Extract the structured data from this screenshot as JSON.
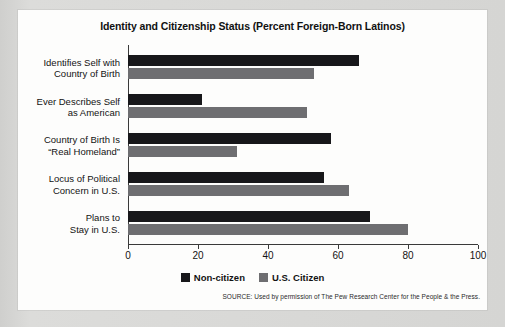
{
  "chart_data": {
    "type": "bar",
    "orientation": "horizontal",
    "title": "Identity and Citizenship Status (Percent Foreign-Born Latinos)",
    "xlabel": "",
    "ylabel": "",
    "xlim": [
      0,
      100
    ],
    "xticks": [
      0,
      20,
      40,
      60,
      80,
      100
    ],
    "xtick_labels": [
      "0",
      "20",
      "40",
      "60",
      "80",
      "100"
    ],
    "grid": false,
    "legend_position": "bottom-center",
    "categories": [
      "Identifies Self with\nCountry of Birth",
      "Ever Describes Self\nas American",
      "Country of Birth Is\n“Real Homeland”",
      "Locus of Political\nConcern in U.S.",
      "Plans to\nStay in U.S."
    ],
    "category_lines": [
      [
        "Identifies Self with",
        "Country of Birth"
      ],
      [
        "Ever Describes Self",
        "as American"
      ],
      [
        "Country of Birth Is",
        "“Real Homeland”"
      ],
      [
        "Locus of Political",
        "Concern in U.S."
      ],
      [
        "Plans to",
        "Stay in U.S."
      ]
    ],
    "series": [
      {
        "name": "Non-citizen",
        "color": "#17171a",
        "values": [
          66,
          21,
          58,
          56,
          69
        ]
      },
      {
        "name": "U.S. Citizen",
        "color": "#6e6e71",
        "values": [
          53,
          51,
          31,
          63,
          80
        ]
      }
    ]
  },
  "legend": {
    "items": [
      {
        "label": "Non-citizen",
        "color": "#17171a"
      },
      {
        "label": "U.S. Citizen",
        "color": "#6e6e71"
      }
    ]
  },
  "source": {
    "text": "SOURCE: Used by permission of The Pew Research Center for the People & the Press."
  }
}
